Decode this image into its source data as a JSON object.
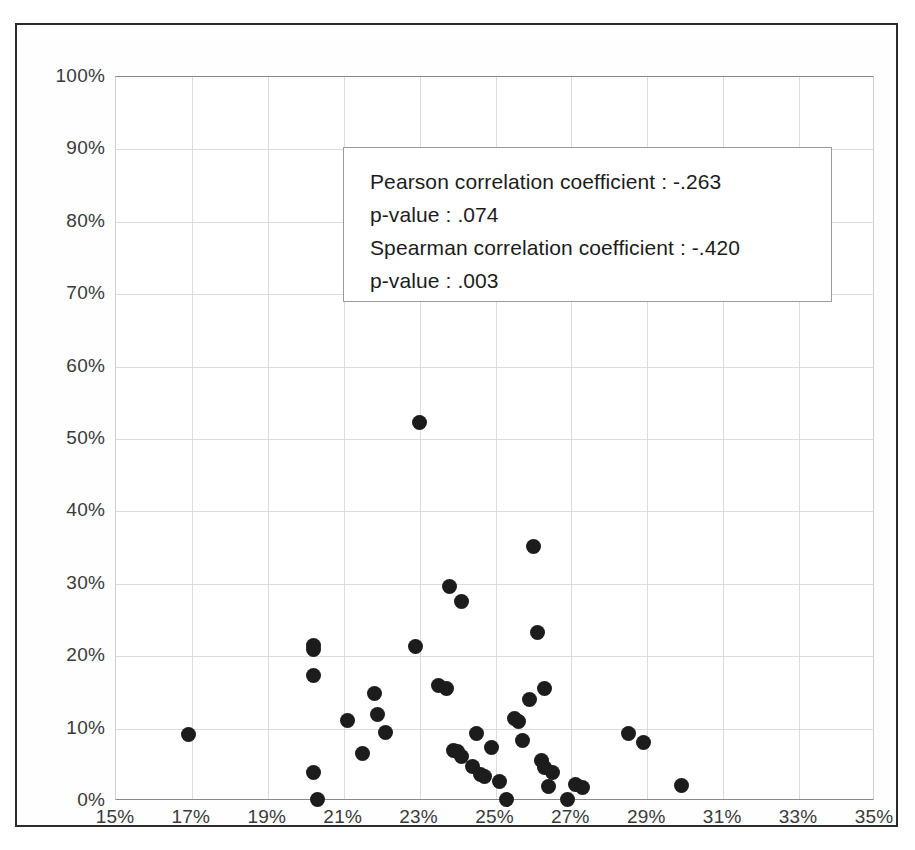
{
  "chart_data": {
    "type": "scatter",
    "title": "",
    "xlabel": "",
    "ylabel": "",
    "xlim": [
      15,
      35
    ],
    "ylim": [
      0,
      100
    ],
    "grid": true,
    "legend_position": "none",
    "x_unit": "%",
    "y_unit": "%",
    "xticks": [
      "15%",
      "17%",
      "19%",
      "21%",
      "23%",
      "25%",
      "27%",
      "29%",
      "31%",
      "33%",
      "35%"
    ],
    "xtick_values": [
      15,
      17,
      19,
      21,
      23,
      25,
      27,
      29,
      31,
      33,
      35
    ],
    "yticks": [
      "0%",
      "10%",
      "20%",
      "30%",
      "40%",
      "50%",
      "60%",
      "70%",
      "80%",
      "90%",
      "100%"
    ],
    "ytick_values": [
      0,
      10,
      20,
      30,
      40,
      50,
      60,
      70,
      80,
      90,
      100
    ],
    "marker_color": "#1c1c1c",
    "marker_shape": "circle",
    "points": [
      [
        16.9,
        9.2
      ],
      [
        20.2,
        21.5
      ],
      [
        20.2,
        20.9
      ],
      [
        20.2,
        17.3
      ],
      [
        20.2,
        4.0
      ],
      [
        20.3,
        0.2
      ],
      [
        21.1,
        11.1
      ],
      [
        21.5,
        6.6
      ],
      [
        21.8,
        14.9
      ],
      [
        21.9,
        11.9
      ],
      [
        22.1,
        9.5
      ],
      [
        22.9,
        21.3
      ],
      [
        23.0,
        52.3
      ],
      [
        23.5,
        16.0
      ],
      [
        23.7,
        15.6
      ],
      [
        23.8,
        29.6
      ],
      [
        23.9,
        7.0
      ],
      [
        24.0,
        6.9
      ],
      [
        24.1,
        27.6
      ],
      [
        24.1,
        6.2
      ],
      [
        24.4,
        4.7
      ],
      [
        24.5,
        9.3
      ],
      [
        24.6,
        3.6
      ],
      [
        24.7,
        3.4
      ],
      [
        24.9,
        7.4
      ],
      [
        25.1,
        2.7
      ],
      [
        25.3,
        0.2
      ],
      [
        25.5,
        11.4
      ],
      [
        25.6,
        11.0
      ],
      [
        25.7,
        8.3
      ],
      [
        25.9,
        14.0
      ],
      [
        26.0,
        35.2
      ],
      [
        26.1,
        23.3
      ],
      [
        26.2,
        5.6
      ],
      [
        26.3,
        15.6
      ],
      [
        26.3,
        4.6
      ],
      [
        26.4,
        2.0
      ],
      [
        26.5,
        3.9
      ],
      [
        26.9,
        0.2
      ],
      [
        27.1,
        2.3
      ],
      [
        27.3,
        1.9
      ],
      [
        28.5,
        9.3
      ],
      [
        28.9,
        8.1
      ],
      [
        29.9,
        2.1
      ]
    ]
  },
  "annotation": {
    "lines": [
      "Pearson correlation coefficient :  -.263",
      "p-value :  .074",
      "Spearman correlation coefficient :  -.420",
      "p-value :  .003"
    ],
    "pearson_r": "-.263",
    "pearson_p": ".074",
    "spearman_rho": "-.420",
    "spearman_p": ".003"
  }
}
